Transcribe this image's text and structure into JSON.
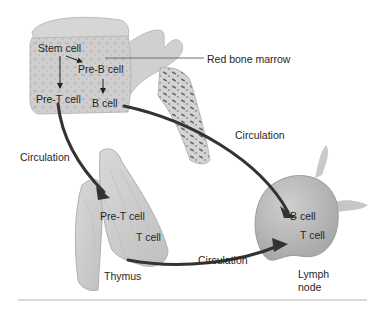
{
  "diagram": {
    "structures": {
      "bone_marrow": "Red bone marrow",
      "thymus": "Thymus",
      "lymph_node_line1": "Lymph",
      "lymph_node_line2": "node"
    },
    "cells": {
      "stem": "Stem cell",
      "pre_b": "Pre-B cell",
      "b_marrow": "B cell",
      "pre_t_marrow": "Pre-T cell",
      "pre_t_thymus": "Pre-T cell",
      "t_thymus": "T cell",
      "b_node": "B cell",
      "t_node": "T cell"
    },
    "flows": {
      "marrow_to_node": "Circulation",
      "marrow_to_thymus": "Circulation",
      "thymus_to_node": "Circulation"
    },
    "colors": {
      "bone": "#c9c9c9",
      "bone_dark": "#a9a9a9",
      "arrow": "#3a3a3a",
      "text": "#262626",
      "rule": "#b0b0b0"
    }
  }
}
